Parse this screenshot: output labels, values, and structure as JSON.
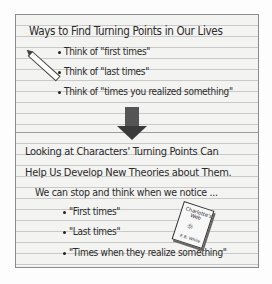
{
  "chart_top": {
    "title": "Ways to Find Turning Points in Our Lives",
    "items": [
      "Think of \"first times\"",
      "Think of \"last times\"",
      "Think of \"times you realized something\""
    ]
  },
  "chart_bottom": {
    "heading_line1": "Looking at Characters' Turning Points Can",
    "heading_line2": "Help Us Develop New Theories about Them.",
    "intro": "We can stop and think when we notice ...",
    "items": [
      "\"First times\"",
      "\"Last times\"",
      "\"Times when they realize something\""
    ]
  },
  "book": {
    "title": "Charlotte's Web",
    "author": "E.B. White",
    "art": "☼"
  },
  "icons": {
    "pencil": "pencil-icon",
    "arrow": "arrow-down-icon",
    "book": "book-icon"
  }
}
